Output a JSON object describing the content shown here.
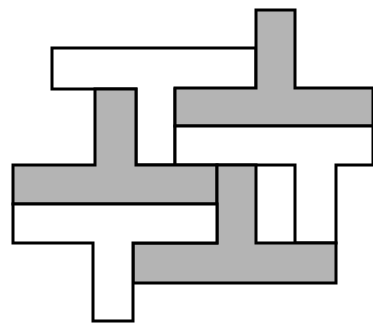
{
  "figure": {
    "colors": {
      "background": "#ffffff",
      "grey_fill": "#b4b4b4",
      "white_fill": "#ffffff",
      "outline": "#000000"
    },
    "stroke_width": 3,
    "tiles": [
      {
        "name": "white-t-top",
        "fill": "white",
        "points": "52,48 256,48 256,89 175,89 175,165 136,165 136,89 52,89"
      },
      {
        "name": "grey-t-top-right",
        "fill": "grey",
        "points": "256,10 295,10 295,88 373,88 373,126 175,126 175,88 256,88"
      },
      {
        "name": "white-t-right",
        "fill": "white",
        "points": "175,126 373,126 373,165 336,165 336,243 295,243 295,165 175,165"
      },
      {
        "name": "grey-t-left",
        "fill": "grey",
        "points": "95,89 136,89 136,165 217,165 217,204 13,204 13,165 95,165"
      },
      {
        "name": "grey-t-bottom-right",
        "fill": "grey",
        "points": "217,165 256,165 256,243 336,243 336,283 133,283 133,243 217,243"
      },
      {
        "name": "white-t-bottom-left",
        "fill": "white",
        "points": "13,204 217,204 217,243 133,243 133,321 93,321 93,243 13,243"
      }
    ]
  }
}
